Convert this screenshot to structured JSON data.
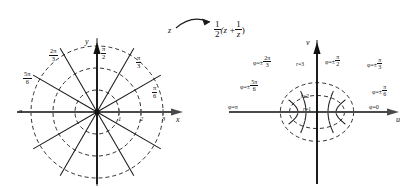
{
  "figure": {
    "map_label": "1/2 (z + 1/z)",
    "source_label": "z",
    "stroke_color": "#1a1a1a",
    "axis_color": "#4a4a4a",
    "background": "#ffffff"
  },
  "transform": {
    "arrow_name": "mapping-arrow",
    "from": "z",
    "expression_num": "1",
    "expression_den": "2",
    "expression_body_open": "(z +",
    "expression_inner_num": "1",
    "expression_inner_den": "z",
    "expression_body_close": ")"
  },
  "left_plot": {
    "name": "z-plane-polar-grid",
    "x_axis_label": "x",
    "y_axis_label": "y",
    "center": [
      97,
      112
    ],
    "unit_px": 22,
    "radial_ticks": [
      "1",
      "2",
      "3"
    ],
    "circles_r": [
      1,
      2,
      3
    ],
    "ray_angles_deg": [
      0,
      30,
      60,
      90,
      120,
      150,
      180,
      210,
      240,
      270,
      300,
      330
    ],
    "angle_labels": [
      {
        "text_num": "π",
        "text_den": "6",
        "whole": "π/6",
        "x": 152,
        "y": 85
      },
      {
        "text_num": "π",
        "text_den": "3",
        "whole": "π/3",
        "x": 136,
        "y": 55
      },
      {
        "text_num": "π",
        "text_den": "2",
        "whole": "π/2",
        "x": 101,
        "y": 46
      },
      {
        "text_num": "2π",
        "text_den": "3",
        "whole": "2π/3",
        "x": 49,
        "y": 48
      },
      {
        "text_num": "5π",
        "text_den": "6",
        "whole": "5π/6",
        "x": 23,
        "y": 71
      },
      {
        "text_num": "π",
        "text_den": "",
        "whole": "π",
        "x": 19,
        "y": 108
      }
    ]
  },
  "right_plot": {
    "name": "w-plane-confocal-grid",
    "u_axis_label": "u",
    "v_axis_label": "v",
    "center": [
      317,
      112
    ],
    "unit_px": 22,
    "ellipse_r": [
      1,
      2,
      3
    ],
    "hyperbola_angles_deg": [
      0,
      30,
      60,
      90,
      120,
      150,
      180
    ],
    "radius_labels": [
      {
        "text": "r=1",
        "x": 303,
        "y": 107
      },
      {
        "text": "r=2",
        "x": 301,
        "y": 94
      },
      {
        "text": "r=3",
        "x": 296,
        "y": 62
      }
    ],
    "phi_labels": [
      {
        "text": "φ=0",
        "x": 369,
        "y": 104
      },
      {
        "text": "φ=±",
        "num": "π",
        "den": "6",
        "x": 372,
        "y": 84
      },
      {
        "text": "φ=±",
        "num": "π",
        "den": "3",
        "x": 367,
        "y": 57
      },
      {
        "text": "φ=±",
        "num": "π",
        "den": "2",
        "x": 325,
        "y": 54
      },
      {
        "text": "φ=±",
        "num": "2π",
        "den": "3",
        "x": 253,
        "y": 55
      },
      {
        "text": "φ=±",
        "num": "5π",
        "den": "6",
        "x": 240,
        "y": 79
      },
      {
        "text": "φ=π",
        "num": "",
        "den": "",
        "x": 228,
        "y": 104
      }
    ]
  },
  "chart_data": {
    "type": "line",
    "xlabel": "x / u",
    "ylabel": "y / v",
    "series": [
      {
        "name": "z-plane circles r",
        "values": [
          1,
          2,
          3
        ]
      },
      {
        "name": "z-plane rays phi (deg)",
        "values": [
          0,
          30,
          60,
          90,
          120,
          150,
          180,
          210,
          240,
          270,
          300,
          330
        ]
      },
      {
        "name": "w-plane ellipses (semi-axes a=(r+1/r)/2, b=(r-1/r)/2) r",
        "values": [
          1,
          2,
          3
        ]
      },
      {
        "name": "w-plane hyperbolas phi (deg)",
        "values": [
          0,
          30,
          60,
          90,
          120,
          150,
          180
        ]
      }
    ]
  }
}
